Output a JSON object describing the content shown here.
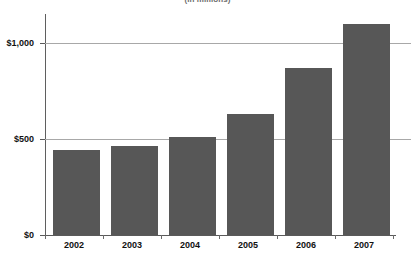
{
  "chart_data": {
    "type": "bar",
    "title": "(in millions)",
    "subtitle": "",
    "xlabel": "",
    "ylabel": "",
    "categories": [
      "2002",
      "2003",
      "2004",
      "2005",
      "2006",
      "2007"
    ],
    "values": [
      445,
      465,
      510,
      630,
      870,
      1100
    ],
    "series": [
      {
        "name": "Amount",
        "values": [
          445,
          465,
          510,
          630,
          870,
          1100
        ]
      }
    ],
    "ylim": [
      0,
      1160
    ],
    "yticks": [
      0,
      500,
      1000
    ],
    "ytick_labels": [
      "$0",
      "$500",
      "$1,000"
    ],
    "grid": true,
    "legend": false,
    "legend_position": "none",
    "bar_color": "#575757",
    "gridline_color": "#a8a8a8",
    "axis_color": "#5a5a5a"
  },
  "axis": {
    "y_labels": [
      "$1,000",
      "$500",
      "$0"
    ],
    "x_labels": [
      "2002",
      "2003",
      "2004",
      "2005",
      "2006",
      "2007"
    ]
  }
}
